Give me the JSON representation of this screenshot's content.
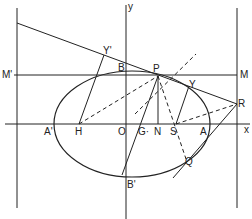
{
  "diagram": {
    "type": "ellipse-focus-directrix-construction",
    "stroke_color": "#222222",
    "background": "#ffffff",
    "labels": {
      "y_axis": "y",
      "x_axis": "x",
      "M_prime": "M'",
      "M": "M",
      "Y_prime": "Y'",
      "Y": "Y",
      "B": "B",
      "B_prime": "B'",
      "P": "P",
      "R": "R",
      "A_prime": "A'",
      "A": "A",
      "H": "H",
      "O": "O",
      "G": "G·",
      "N": "N",
      "S": "S",
      "Q": "Q"
    }
  }
}
